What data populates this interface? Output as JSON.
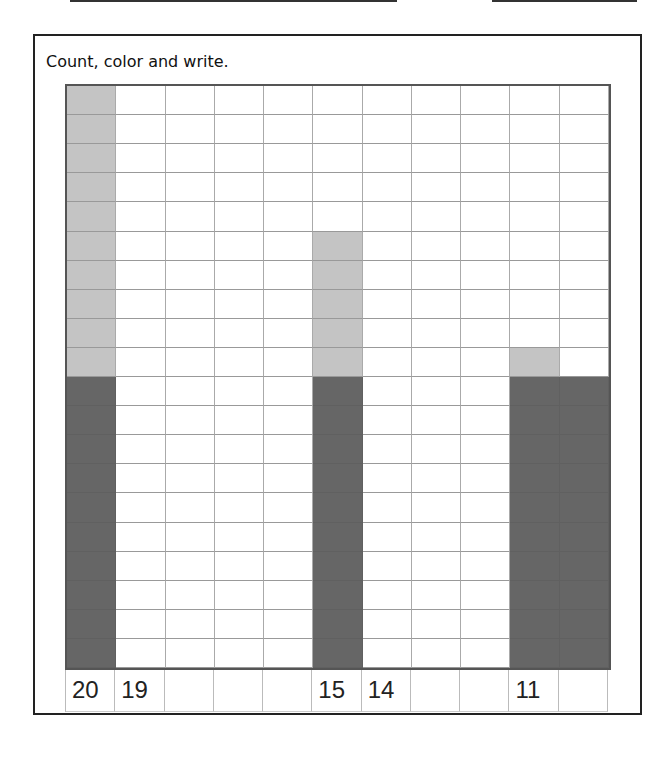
{
  "worksheet": {
    "instruction": "Count, color and write.",
    "labels": [
      "20",
      "19",
      "",
      "",
      "",
      "15",
      "14",
      "",
      "",
      "11",
      ""
    ],
    "colors": {
      "light": "#c4c4c4",
      "dark": "#666666"
    }
  },
  "chart_data": {
    "type": "bar",
    "title": "Count, color and write.",
    "categories": [
      "col1",
      "col2",
      "col3",
      "col4",
      "col5",
      "col6",
      "col7",
      "col8",
      "col9",
      "col10",
      "col11"
    ],
    "tick_labels": [
      "20",
      "19",
      "",
      "",
      "",
      "15",
      "14",
      "",
      "",
      "11",
      ""
    ],
    "values": [
      20,
      0,
      0,
      0,
      0,
      15,
      0,
      0,
      0,
      11,
      10
    ],
    "series": [
      {
        "name": "dark (tens)",
        "values": [
          10,
          0,
          0,
          0,
          0,
          10,
          0,
          0,
          0,
          10,
          10
        ]
      },
      {
        "name": "light (ones)",
        "values": [
          10,
          0,
          0,
          0,
          0,
          5,
          0,
          0,
          0,
          1,
          0
        ]
      }
    ],
    "ylim": [
      0,
      20
    ],
    "grid": true
  }
}
